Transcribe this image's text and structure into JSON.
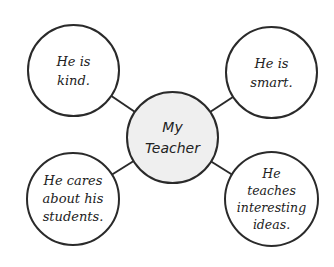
{
  "diagram": {
    "type": "bubble map",
    "center": {
      "label": "My\nTeacher",
      "fill": "#efefef"
    },
    "nodes": [
      {
        "id": "top-left",
        "label": "He is\nkind."
      },
      {
        "id": "top-right",
        "label": "He is\nsmart."
      },
      {
        "id": "bottom-left",
        "label": "He cares\nabout his\nstudents."
      },
      {
        "id": "bottom-right",
        "label": "He\nteaches\ninteresting\nideas."
      }
    ],
    "stroke_color": "#2a2a2a"
  }
}
